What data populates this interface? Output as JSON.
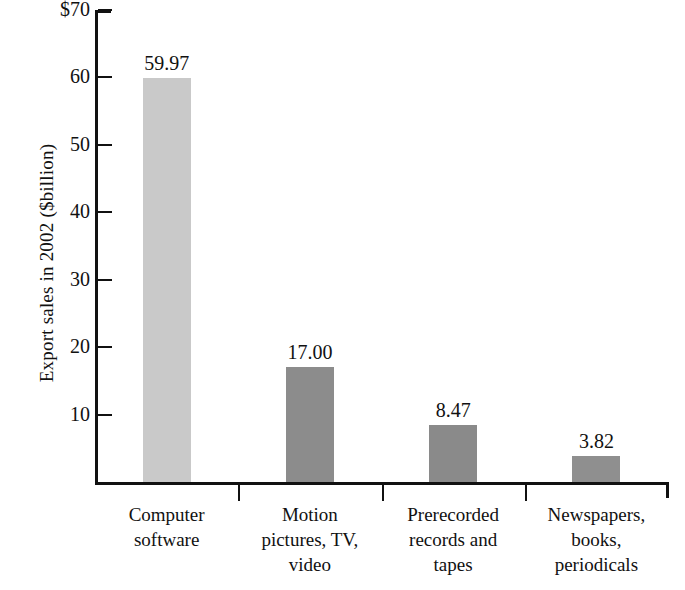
{
  "chart_data": {
    "type": "bar",
    "title": "",
    "xlabel": "",
    "ylabel": "Export sales in 2002 ($billion)",
    "ylim": [
      0,
      70
    ],
    "yticks": [
      "$70",
      "60",
      "50",
      "40",
      "30",
      "20",
      "10"
    ],
    "ytick_values": [
      70,
      60,
      50,
      40,
      30,
      20,
      10
    ],
    "grid": false,
    "legend": null,
    "categories": [
      "Computer software",
      "Motion pictures, TV, video",
      "Prerecorded records and tapes",
      "Newspapers, books, periodicals"
    ],
    "category_lines": [
      [
        "Computer",
        "software"
      ],
      [
        "Motion",
        "pictures, TV,",
        "video"
      ],
      [
        "Prerecorded",
        "records and",
        "tapes"
      ],
      [
        "Newspapers,",
        "books,",
        "periodicals"
      ]
    ],
    "values": [
      59.97,
      17.0,
      8.47,
      3.82
    ],
    "value_labels": [
      "59.97",
      "17.00",
      "8.47",
      "3.82"
    ],
    "bar_colors": [
      "#c9c9c9",
      "#8c8c8c",
      "#8a8a8a",
      "#8f8f8f"
    ],
    "axis_color": "#111111"
  }
}
